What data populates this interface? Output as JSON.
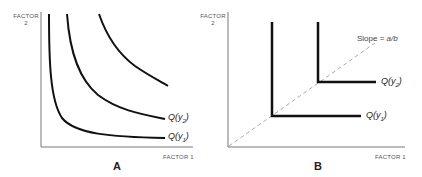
{
  "panels": [
    {
      "id": "A",
      "letter": "A",
      "y_axis_label_line1": "FACTOR",
      "y_axis_label_line2": "2",
      "x_axis_label": "FACTOR 1",
      "curves": [
        {
          "name": "Q(y1)",
          "label_prefix": "Q(y",
          "label_sub": "1",
          "label_suffix": ")"
        },
        {
          "name": "Q(y2)",
          "label_prefix": "Q(y",
          "label_sub": "2",
          "label_suffix": ")"
        },
        {
          "name": "unlabeled-isoquant",
          "label_prefix": "",
          "label_sub": "",
          "label_suffix": ""
        }
      ],
      "description": "Smooth convex isoquants (substitutable factors)"
    },
    {
      "id": "B",
      "letter": "B",
      "y_axis_label_line1": "FACTOR",
      "y_axis_label_line2": "2",
      "x_axis_label": "FACTOR 1",
      "slope_label_prefix": "Slope = ",
      "slope_label_value": "a/b",
      "curves": [
        {
          "name": "Q(y1)",
          "label_prefix": "Q(y",
          "label_sub": "1",
          "label_suffix": ")"
        },
        {
          "name": "Q(y2)",
          "label_prefix": "Q(y",
          "label_sub": "2",
          "label_suffix": ")"
        }
      ],
      "description": "L-shaped (Leontief) isoquants with dashed expansion ray"
    }
  ],
  "colors": {
    "curve": "#111111",
    "axis": "#777777",
    "ray": "#aaaaaa"
  }
}
